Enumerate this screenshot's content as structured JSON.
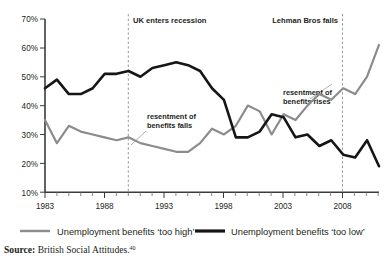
{
  "figure": {
    "source_prefix": "Source:",
    "source_text": " British Social Attitudes.",
    "source_footnote": "40"
  },
  "legend": {
    "position": "below-axis",
    "items": [
      {
        "label": "Unemployment benefits ‘too high’",
        "color": "#8c8c8c"
      },
      {
        "label": "Unemployment benefits ‘too low’",
        "color": "#161616"
      }
    ]
  },
  "chart_data": {
    "type": "line",
    "title": "",
    "subtitle": "",
    "xlabel": "",
    "ylabel": "",
    "xlim": [
      1983,
      2011
    ],
    "ylim": [
      10,
      70
    ],
    "grid": false,
    "ytick_labels": [
      "10%",
      "20%",
      "30%",
      "40%",
      "50%",
      "60%",
      "70%"
    ],
    "yticks": [
      10,
      20,
      30,
      40,
      50,
      60,
      70
    ],
    "xtick_labels": [
      "1983",
      "1988",
      "1993",
      "1998",
      "2003",
      "2008"
    ],
    "xticks": [
      1983,
      1988,
      1993,
      1998,
      2003,
      2008
    ],
    "minor_xtick_interval": 1,
    "x": [
      1983,
      1984,
      1985,
      1986,
      1987,
      1988,
      1989,
      1990,
      1991,
      1992,
      1993,
      1994,
      1995,
      1996,
      1997,
      1998,
      1999,
      2000,
      2001,
      2002,
      2003,
      2004,
      2005,
      2006,
      2007,
      2008,
      2009,
      2010,
      2011
    ],
    "series": [
      {
        "name": "Unemployment benefits ‘too high’",
        "color": "#8c8c8c",
        "values": [
          35,
          27,
          33,
          31,
          30,
          29,
          28,
          29,
          27,
          26,
          25,
          24,
          24,
          27,
          32,
          30,
          33,
          40,
          38,
          30,
          37,
          35,
          40,
          44,
          42,
          46,
          44,
          50,
          61
        ]
      },
      {
        "name": "Unemployment benefits ‘too low’",
        "color": "#161616",
        "values": [
          46,
          49,
          44,
          44,
          46,
          51,
          51,
          52,
          50,
          53,
          54,
          55,
          54,
          52,
          46,
          42,
          29,
          29,
          31,
          37,
          36,
          29,
          30,
          26,
          28,
          23,
          22,
          28,
          19
        ]
      }
    ],
    "annotations": [
      {
        "name": "uk-enters-recession",
        "text": "UK enters recession",
        "x": 1990,
        "type": "event-line"
      },
      {
        "name": "lehman-bros-falls",
        "text": "Lehman Bros falls",
        "x": 2008,
        "type": "event-line"
      },
      {
        "name": "resentment-of-benefits-falls",
        "line1": "resentment of",
        "line2": "benefits falls",
        "x": 1992,
        "y": 36
      },
      {
        "name": "resentment-of-benefits-rises",
        "line1": "resentment of",
        "line2": "benefits rises",
        "x": 2004,
        "y": 44
      }
    ]
  }
}
